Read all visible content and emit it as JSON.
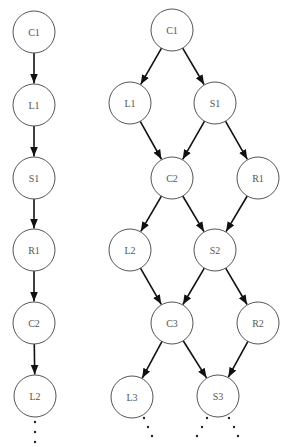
{
  "diagram": {
    "left": {
      "title": "",
      "radius": 21,
      "nodes": [
        {
          "id": "C1",
          "label": "C1",
          "x": 34,
          "y": 32
        },
        {
          "id": "L1",
          "label": "L1",
          "x": 34,
          "y": 105
        },
        {
          "id": "S1",
          "label": "S1",
          "x": 34,
          "y": 178
        },
        {
          "id": "R1",
          "label": "R1",
          "x": 34,
          "y": 250
        },
        {
          "id": "C2",
          "label": "C2",
          "x": 34,
          "y": 323
        },
        {
          "id": "L2",
          "label": "L2",
          "x": 35,
          "y": 396
        }
      ],
      "edges": [
        [
          "C1",
          "L1"
        ],
        [
          "L1",
          "S1"
        ],
        [
          "S1",
          "R1"
        ],
        [
          "R1",
          "C2"
        ],
        [
          "C2",
          "L2"
        ]
      ],
      "continuation_dots": [
        [
          35,
          422
        ],
        [
          35,
          432
        ],
        [
          35,
          442
        ]
      ]
    },
    "right": {
      "title": "",
      "radius": 21,
      "nodes": [
        {
          "id": "C1",
          "label": "C1",
          "x": 172,
          "y": 30
        },
        {
          "id": "L1",
          "label": "L1",
          "x": 130,
          "y": 103
        },
        {
          "id": "S1",
          "label": "S1",
          "x": 215,
          "y": 103
        },
        {
          "id": "C2",
          "label": "C2",
          "x": 172,
          "y": 178
        },
        {
          "id": "R1",
          "label": "R1",
          "x": 258,
          "y": 178
        },
        {
          "id": "L2",
          "label": "L2",
          "x": 130,
          "y": 250
        },
        {
          "id": "S2",
          "label": "S2",
          "x": 215,
          "y": 250
        },
        {
          "id": "C3",
          "label": "C3",
          "x": 172,
          "y": 323
        },
        {
          "id": "R2",
          "label": "R2",
          "x": 258,
          "y": 323
        },
        {
          "id": "L3",
          "label": "L3",
          "x": 132,
          "y": 397
        },
        {
          "id": "S3",
          "label": "S3",
          "x": 218,
          "y": 396
        }
      ],
      "edges": [
        [
          "C1",
          "L1"
        ],
        [
          "C1",
          "S1"
        ],
        [
          "L1",
          "C2"
        ],
        [
          "S1",
          "C2"
        ],
        [
          "S1",
          "R1"
        ],
        [
          "C2",
          "L2"
        ],
        [
          "C2",
          "S2"
        ],
        [
          "R1",
          "S2"
        ],
        [
          "L2",
          "C3"
        ],
        [
          "S2",
          "C3"
        ],
        [
          "S2",
          "R2"
        ],
        [
          "C3",
          "L3"
        ],
        [
          "C3",
          "S3"
        ],
        [
          "R2",
          "S3"
        ]
      ],
      "continuation_dots": [
        [
          144,
          418
        ],
        [
          148,
          427
        ],
        [
          152,
          436
        ],
        [
          207,
          418
        ],
        [
          202,
          427
        ],
        [
          197,
          436
        ],
        [
          229,
          418
        ],
        [
          234,
          427
        ],
        [
          238,
          436
        ]
      ]
    }
  }
}
